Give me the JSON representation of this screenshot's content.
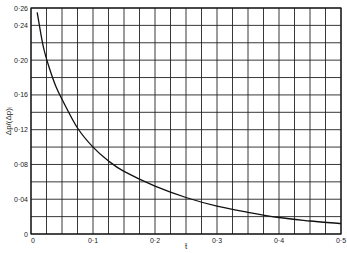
{
  "chart_data": {
    "type": "line",
    "title": "",
    "xlabel": "t̄",
    "ylabel": "Δp/(Δp)ᵢ",
    "xlim": [
      0,
      0.5
    ],
    "ylim": [
      0,
      0.26
    ],
    "grid": true,
    "x_ticks": [
      "0",
      "0·1",
      "0·2",
      "0·3",
      "0·4",
      "0·5"
    ],
    "y_ticks": [
      "0",
      "0·04",
      "0·08",
      "0·12",
      "0·16",
      "0·20",
      "0·24",
      "0·26"
    ],
    "x_minor_step": 0.025,
    "y_minor_step": 0.02,
    "series": [
      {
        "name": "Δp/(Δp)ᵢ vs t̄",
        "x": [
          0.01,
          0.02,
          0.03,
          0.04,
          0.05,
          0.075,
          0.1,
          0.125,
          0.15,
          0.2,
          0.25,
          0.3,
          0.35,
          0.4,
          0.45,
          0.5
        ],
        "values": [
          0.255,
          0.215,
          0.19,
          0.17,
          0.155,
          0.122,
          0.1,
          0.084,
          0.072,
          0.055,
          0.042,
          0.032,
          0.025,
          0.019,
          0.015,
          0.012
        ]
      }
    ],
    "legend": "none"
  }
}
